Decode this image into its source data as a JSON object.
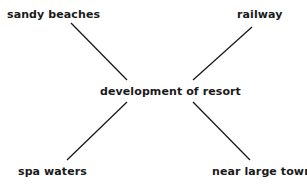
{
  "diagram": {
    "type": "spider-diagram",
    "center": {
      "label": "development of resort"
    },
    "factors": [
      {
        "position": "top-left",
        "label": "sandy beaches"
      },
      {
        "position": "top-right",
        "label": "railway"
      },
      {
        "position": "bottom-left",
        "label": "spa waters"
      },
      {
        "position": "bottom-right",
        "label": "near large towns"
      }
    ],
    "colors": {
      "text": "#1a1a1a",
      "line": "#1a1a1a",
      "background": "#ffffff"
    }
  }
}
